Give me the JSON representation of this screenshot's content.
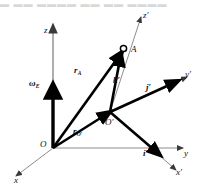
{
  "figure": {
    "kind": "vector-diagram",
    "top_strip_text": "▬ ▬▬ ▬▬▬▬ ▬▬  ▬▬  ▬▬▬▬",
    "colors": {
      "background": "#ffffff",
      "ink": "#111111",
      "thin_axis": "#8d8d8d",
      "vector": "#000000"
    },
    "axes": [
      {
        "id": "z",
        "label": "z",
        "prime": false,
        "origin": "O",
        "style": "thin"
      },
      {
        "id": "y",
        "label": "y",
        "prime": false,
        "origin": "O",
        "style": "thin"
      },
      {
        "id": "x",
        "label": "x",
        "prime": false,
        "origin": "O",
        "style": "thin"
      },
      {
        "id": "z-prime",
        "label": "z",
        "prime": true,
        "origin": "O'",
        "style": "thin"
      },
      {
        "id": "y-prime",
        "label": "y",
        "prime": true,
        "origin": "O'",
        "style": "thin"
      },
      {
        "id": "x-prime",
        "label": "x",
        "prime": true,
        "origin": "O'",
        "style": "thin"
      }
    ],
    "points": [
      {
        "id": "origin-O",
        "label": "O",
        "prime": false,
        "marker": "none"
      },
      {
        "id": "origin-Op",
        "label": "O",
        "prime": true,
        "marker": "none"
      },
      {
        "id": "point-A",
        "label": "A",
        "prime": false,
        "marker": "open-circle"
      }
    ],
    "vectors": [
      {
        "id": "omega-E",
        "base": "ω",
        "sub": "E",
        "prime": false,
        "from": "O",
        "to": "z-axis",
        "bold": true
      },
      {
        "id": "r-A",
        "base": "r",
        "sub": "A",
        "prime": false,
        "from": "O",
        "to": "A",
        "bold": true
      },
      {
        "id": "r-Oprime",
        "base": "r",
        "sub": "O'",
        "prime": false,
        "from": "O",
        "to": "O'",
        "bold": true
      },
      {
        "id": "k-prime",
        "base": "k",
        "sub": "",
        "prime": true,
        "from": "O'",
        "to": "z-prime",
        "bold": true
      },
      {
        "id": "j-prime",
        "base": "j",
        "sub": "",
        "prime": true,
        "from": "O'",
        "to": "y-prime",
        "bold": true
      },
      {
        "id": "i-prime",
        "base": "i",
        "sub": "",
        "prime": true,
        "from": "O'",
        "to": "x-prime",
        "bold": true
      }
    ],
    "labels": {
      "z": "z",
      "z_prime": "z′",
      "y": "y",
      "y_prime": "y′",
      "x": "x",
      "x_prime": "x′",
      "O": "O",
      "O_prime": "O′",
      "A": "A",
      "omega_base": "ω",
      "omega_sub": "E",
      "rA_base": "r",
      "rA_sub": "A",
      "rOp_base": "r",
      "rOp_sub": "O′",
      "k_prime": "k′",
      "j_prime": "j′",
      "i_prime": "i′"
    }
  }
}
